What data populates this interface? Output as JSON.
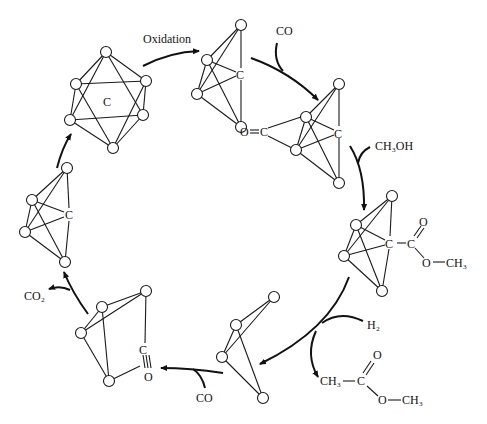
{
  "figure": {
    "labels": {
      "oxidation": "Oxidation",
      "co_in_top": "CO",
      "ch3oh": "CH₃OH",
      "h2": "H₂",
      "co_out_bottom": "CO",
      "co2": "CO₂",
      "carbide_c": "C",
      "ketenyl_o": "O",
      "ketenyl_c": "C",
      "ester_c1": "C",
      "ester_c2": "C",
      "ester_o_double": "O",
      "ester_o_single": "O",
      "ester_ch3": "CH₃",
      "product_ch3_left": "CH₃",
      "product_c": "C",
      "product_o_double": "O",
      "product_o_single": "O",
      "product_ch3_right": "CH₃",
      "carbonyl_c": "C",
      "carbonyl_o": "O"
    },
    "clusters": [
      {
        "name": "octahedral-carbide-cluster",
        "center_label": "C"
      },
      {
        "name": "butterfly-carbide-cluster",
        "center_label": "C"
      },
      {
        "name": "ketenylidene-cluster",
        "center_label": "C"
      },
      {
        "name": "methoxycarbonyl-methylidyne-cluster",
        "center_label": "C"
      },
      {
        "name": "butterfly-cluster-after-hydrogenolysis",
        "center_label": ""
      },
      {
        "name": "carbonyl-bridged-cluster",
        "center_label": "C"
      },
      {
        "name": "butterfly-carbide-cluster-regenerated",
        "center_label": "C"
      }
    ],
    "caption_fragment": "...(cropped caption text line)..."
  }
}
